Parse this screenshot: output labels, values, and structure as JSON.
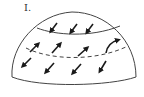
{
  "diagram": {
    "label": "I.",
    "colors": {
      "line": "#444444",
      "arrow": "#1a1a1a",
      "background": "#ffffff"
    },
    "bands": [
      {
        "name": "top-band",
        "boundary_below": "solid",
        "arrow_direction": "down-left",
        "arrow_count": 3
      },
      {
        "name": "middle-band",
        "boundary_below": "dashed",
        "arrow_direction": "up-right",
        "arrow_count": 4
      },
      {
        "name": "bottom-band",
        "boundary_below": "outline",
        "arrow_direction": "down-left",
        "arrow_count": 4
      }
    ],
    "arrows": {
      "top": [
        {
          "x": 53,
          "y": 29,
          "dir": "down-left"
        },
        {
          "x": 72,
          "y": 30,
          "dir": "down-left"
        },
        {
          "x": 88,
          "y": 30,
          "dir": "down-left"
        }
      ],
      "middle": [
        {
          "x": 36,
          "y": 46,
          "dir": "up-right"
        },
        {
          "x": 57,
          "y": 46,
          "dir": "up-right"
        },
        {
          "x": 83,
          "y": 50,
          "dir": "up-right"
        },
        {
          "x": 114,
          "y": 46,
          "dir": "up-right-curved"
        }
      ],
      "bottom": [
        {
          "x": 25,
          "y": 63,
          "dir": "down-left"
        },
        {
          "x": 48,
          "y": 69,
          "dir": "down-left"
        },
        {
          "x": 75,
          "y": 70,
          "dir": "down-left"
        },
        {
          "x": 101,
          "y": 68,
          "dir": "down-left"
        }
      ]
    }
  }
}
